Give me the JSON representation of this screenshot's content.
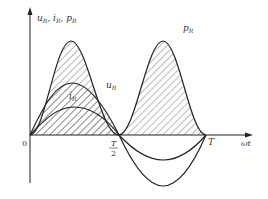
{
  "diagram": {
    "title": "",
    "y_axis_label": {
      "parts": [
        {
          "base": "u",
          "sub": "R"
        },
        {
          "base": "i",
          "sub": "R"
        },
        {
          "base": "p",
          "sub": "R"
        }
      ],
      "separator": ", "
    },
    "x_axis_label": "ωt",
    "origin_label": "0",
    "tick_half": {
      "num": "T",
      "den": "2"
    },
    "tick_full": "T",
    "curves": [
      {
        "name": "p_R",
        "label_base": "p",
        "label_sub": "R",
        "type": "sin^2",
        "hatched": true
      },
      {
        "name": "u_R",
        "label_base": "u",
        "label_sub": "R",
        "type": "sin",
        "hatched": true
      },
      {
        "name": "i_R",
        "label_base": "i",
        "label_sub": "R",
        "type": "sin",
        "hatched": true
      }
    ],
    "colors": {
      "line": "#222222",
      "hatch": "#555555",
      "background": "#ffffff"
    }
  }
}
